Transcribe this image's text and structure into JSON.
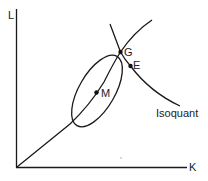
{
  "diagram": {
    "type": "economics-isoquant",
    "axes": {
      "y_label": "L",
      "x_label": "K"
    },
    "curves": {
      "isoquant_label": "Isoquant",
      "expansion_path": "ray from origin through M and G",
      "ellipse": "iso-cost/contour ellipse centered at M"
    },
    "points": [
      {
        "label": "G",
        "x": 120.5,
        "y": 52
      },
      {
        "label": "E",
        "x": 130.5,
        "y": 66
      },
      {
        "label": "M",
        "x": 96.5,
        "y": 92.5
      }
    ],
    "colors": {
      "line": "#1a1a1a",
      "text": "#222222",
      "background": "#ffffff"
    }
  }
}
